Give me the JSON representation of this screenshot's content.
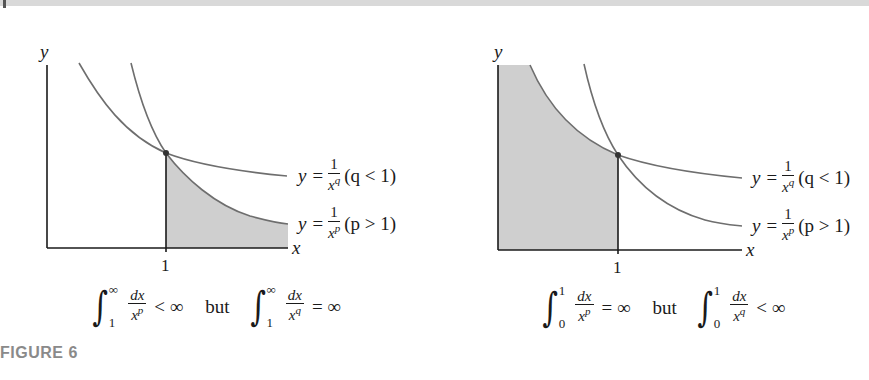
{
  "figure": {
    "caption": "FIGURE 6",
    "left_panel": {
      "y_axis_label": "y",
      "x_axis_label": "x",
      "tick_label": "1",
      "curve_q": {
        "lhs": "y =",
        "num": "1",
        "den_base": "x",
        "den_exp": "q",
        "condition": "(q < 1)"
      },
      "curve_p": {
        "lhs": "y =",
        "num": "1",
        "den_base": "x",
        "den_exp": "p",
        "condition": "(p > 1)"
      },
      "shaded_region": "area under y=1/x^p for x ≥ 1",
      "equation": {
        "int1": {
          "lower": "1",
          "upper": "∞",
          "num": "dx",
          "den_base": "x",
          "den_exp": "p",
          "relation": "< ∞"
        },
        "connector": "but",
        "int2": {
          "lower": "1",
          "upper": "∞",
          "num": "dx",
          "den_base": "x",
          "den_exp": "q",
          "relation": "= ∞"
        }
      }
    },
    "right_panel": {
      "y_axis_label": "y",
      "x_axis_label": "x",
      "tick_label": "1",
      "curve_q": {
        "lhs": "y =",
        "num": "1",
        "den_base": "x",
        "den_exp": "q",
        "condition": "(q < 1)"
      },
      "curve_p": {
        "lhs": "y =",
        "num": "1",
        "den_base": "x",
        "den_exp": "p",
        "condition": "(p > 1)"
      },
      "shaded_region": "area under y=1/x^p for 0 < x ≤ 1",
      "equation": {
        "int1": {
          "lower": "0",
          "upper": "1",
          "num": "dx",
          "den_base": "x",
          "den_exp": "p",
          "relation": "= ∞"
        },
        "connector": "but",
        "int2": {
          "lower": "0",
          "upper": "1",
          "num": "dx",
          "den_base": "x",
          "den_exp": "q",
          "relation": "< ∞"
        }
      }
    },
    "colors": {
      "curve": "#6e6e6e",
      "axis": "#1a1a1a",
      "shade": "#cfcfcf",
      "caption": "#8a8a8a"
    }
  }
}
